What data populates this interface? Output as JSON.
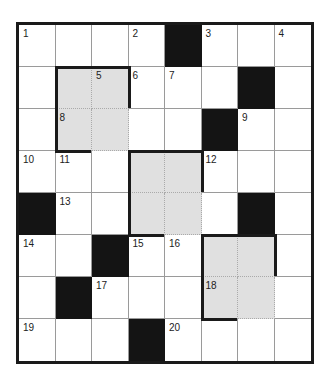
{
  "puzzle": {
    "rows": 8,
    "cols": 8,
    "cell_width": 36.5,
    "cell_height": 42,
    "grid": [
      [
        "W1",
        "W",
        "W",
        "W2",
        "B",
        "W3",
        "W",
        "W4"
      ],
      [
        "W",
        "G",
        "G5",
        "W6",
        "W7",
        "W",
        "B",
        "W"
      ],
      [
        "W",
        "G8",
        "G",
        "W",
        "W",
        "B",
        "W9",
        "W"
      ],
      [
        "W10",
        "W11",
        "W",
        "G",
        "G",
        "W12",
        "W",
        "W"
      ],
      [
        "B",
        "W13",
        "W",
        "G",
        "G",
        "W",
        "B",
        "W"
      ],
      [
        "W14",
        "W",
        "B",
        "W15",
        "W16",
        "G",
        "G",
        "W"
      ],
      [
        "W",
        "B",
        "W17",
        "W",
        "W",
        "G18",
        "G",
        "W"
      ],
      [
        "W19",
        "W",
        "W",
        "B",
        "W20",
        "W",
        "W",
        "W"
      ]
    ],
    "shaded_blocks": [
      {
        "row": 1,
        "col": 1,
        "rows": 2,
        "cols": 2
      },
      {
        "row": 3,
        "col": 3,
        "rows": 2,
        "cols": 2
      },
      {
        "row": 5,
        "col": 5,
        "rows": 2,
        "cols": 2
      }
    ],
    "colors": {
      "black": "#141414",
      "shade": "#e0e0e0",
      "line": "#9a9a9a",
      "border": "#1a1a1a"
    }
  }
}
